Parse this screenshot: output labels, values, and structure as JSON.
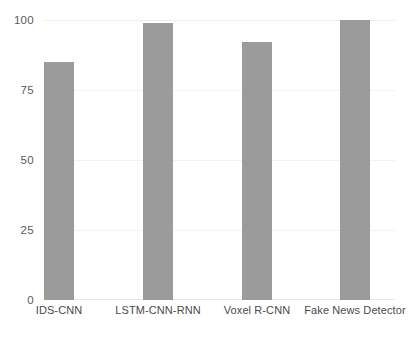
{
  "chart_data": {
    "type": "bar",
    "title": "",
    "subtitle": "",
    "xlabel": "",
    "ylabel": "",
    "categories": [
      "IDS-CNN",
      "LSTM-CNN-RNN",
      "Voxel R-CNN",
      "Fake News Detector"
    ],
    "values": [
      85,
      99,
      92,
      100
    ],
    "series": [
      {
        "name": "",
        "values": [
          85,
          99,
          92,
          100
        ]
      }
    ],
    "ylim": [
      0,
      100
    ],
    "yticks": [
      0,
      25,
      50,
      75,
      100
    ],
    "ytick_labels": [
      "0",
      "25",
      "50",
      "75",
      "100"
    ],
    "grid": true,
    "grid_axis": "y",
    "legend": false,
    "legend_position": "none",
    "annotations": [],
    "bar_color": "#9b9b9b",
    "background_color": "#ffffff",
    "gridline_color": "#f2f2f2",
    "axis_text_color": "#4a4a4a"
  }
}
